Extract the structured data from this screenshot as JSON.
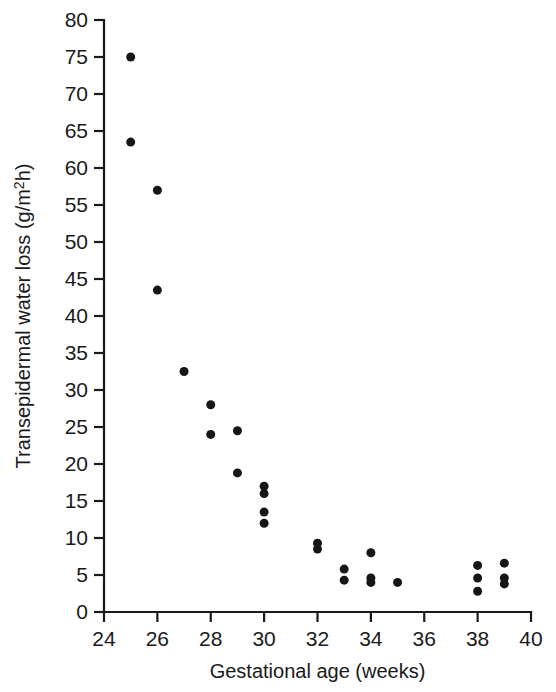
{
  "figure": {
    "background": "#ffffff",
    "point_color": "#161616",
    "axis_color": "#1a1a1a"
  },
  "chart_data": {
    "type": "scatter",
    "title": "",
    "xlabel": "Gestational age (weeks)",
    "ylabel": "Transepidermal water loss (g/m²h)",
    "ylabel_parts": {
      "main": "Transepidermal water loss (g/m",
      "superscript": "2",
      "tail": "h)"
    },
    "xlim": [
      24,
      40
    ],
    "ylim": [
      0,
      80
    ],
    "xticks": [
      24,
      26,
      28,
      30,
      32,
      34,
      36,
      38,
      40
    ],
    "xtick_labels": [
      "24",
      "26",
      "28",
      "30",
      "32",
      "34",
      "36",
      "38",
      "40"
    ],
    "xtick_minor_step": 1,
    "yticks": [
      0,
      5,
      10,
      15,
      20,
      25,
      30,
      35,
      40,
      45,
      50,
      55,
      60,
      65,
      70,
      75,
      80
    ],
    "ytick_labels": [
      "0",
      "5",
      "10",
      "15",
      "20",
      "25",
      "30",
      "35",
      "40",
      "45",
      "50",
      "55",
      "60",
      "65",
      "70",
      "75",
      "80"
    ],
    "grid": false,
    "legend": null,
    "marker": "filled-circle",
    "marker_size_px": 9,
    "x": [
      25,
      25,
      26,
      26,
      27,
      28,
      28,
      29,
      29,
      30,
      30,
      30,
      30,
      32,
      32,
      33,
      33,
      34,
      34,
      34,
      35,
      38,
      38,
      38,
      39,
      39,
      39
    ],
    "y": [
      75.0,
      63.5,
      57.0,
      43.5,
      32.5,
      28.0,
      24.0,
      24.5,
      18.8,
      17.0,
      16.0,
      13.5,
      12.0,
      9.3,
      8.5,
      5.8,
      4.3,
      8.0,
      4.6,
      4.0,
      4.0,
      6.3,
      4.6,
      2.8,
      6.6,
      4.6,
      3.8
    ],
    "points": [
      {
        "x": 25,
        "y": 75.0
      },
      {
        "x": 25,
        "y": 63.5
      },
      {
        "x": 26,
        "y": 57.0
      },
      {
        "x": 26,
        "y": 43.5
      },
      {
        "x": 27,
        "y": 32.5
      },
      {
        "x": 28,
        "y": 28.0
      },
      {
        "x": 28,
        "y": 24.0
      },
      {
        "x": 29,
        "y": 24.5
      },
      {
        "x": 29,
        "y": 18.8
      },
      {
        "x": 30,
        "y": 17.0
      },
      {
        "x": 30,
        "y": 16.0
      },
      {
        "x": 30,
        "y": 13.5
      },
      {
        "x": 30,
        "y": 12.0
      },
      {
        "x": 32,
        "y": 9.3
      },
      {
        "x": 32,
        "y": 8.5
      },
      {
        "x": 33,
        "y": 5.8
      },
      {
        "x": 33,
        "y": 4.3
      },
      {
        "x": 34,
        "y": 8.0
      },
      {
        "x": 34,
        "y": 4.6
      },
      {
        "x": 34,
        "y": 4.0
      },
      {
        "x": 35,
        "y": 4.0
      },
      {
        "x": 38,
        "y": 6.3
      },
      {
        "x": 38,
        "y": 4.6
      },
      {
        "x": 38,
        "y": 2.8
      },
      {
        "x": 39,
        "y": 6.6
      },
      {
        "x": 39,
        "y": 4.6
      },
      {
        "x": 39,
        "y": 3.8
      }
    ]
  }
}
